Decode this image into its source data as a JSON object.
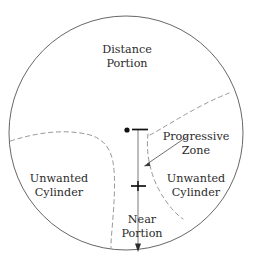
{
  "diagram": {
    "type": "schematic",
    "colors": {
      "outline": "#555555",
      "dashed": "#8a8a8a",
      "text": "#2b2b2b",
      "marker": "#111111",
      "leader": "#4a4a4a",
      "background": "#ffffff"
    },
    "lens": {
      "shape": "circle",
      "center_x": 126,
      "center_y": 133,
      "radius": 117
    },
    "labels": {
      "distance_portion_line1": "Distance",
      "distance_portion_line2": "Portion",
      "progressive_zone_line1": "Progressive",
      "progressive_zone_line2": "Zone",
      "unwanted_cylinder_left_line1": "Unwanted",
      "unwanted_cylinder_left_line2": "Cylinder",
      "unwanted_cylinder_right_line1": "Unwanted",
      "unwanted_cylinder_right_line2": "Cylinder",
      "near_portion_line1": "Near",
      "near_portion_line2": "Portion"
    },
    "markers": {
      "fitting_cross_dot": "filled-dot",
      "distance_reference_tick": "horizontal-tick",
      "near_reference_cross": "plus-tick",
      "meridian_arrow": "down-arrow"
    }
  }
}
